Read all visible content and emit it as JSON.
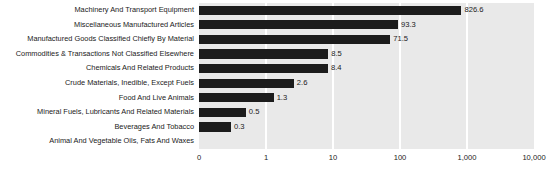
{
  "chart_data": {
    "type": "bar",
    "orientation": "horizontal",
    "title": "",
    "xlabel": "",
    "ylabel": "",
    "xscale": "log",
    "grid": true,
    "legend": false,
    "xticks": [
      "0",
      "1",
      "10",
      "100",
      "1,000",
      "10,000"
    ],
    "xtick_values": [
      0,
      1,
      10,
      100,
      1000,
      10000
    ],
    "categories": [
      "Machinery And Transport Equipment",
      "Miscellaneous Manufactured Articles",
      "Manufactured Goods Classified Chiefly By Material",
      "Commodities & Transactions Not Classified Elsewhere",
      "Chemicals And Related Products",
      "Crude Materials, Inedible, Except Fuels",
      "Food And Live Animals",
      "Mineral Fuels, Lubricants And Related Materials",
      "Beverages And Tobacco",
      "Animal And Vegetable Oils, Fats And Waxes"
    ],
    "values": [
      826.6,
      93.3,
      71.5,
      8.5,
      8.4,
      2.6,
      1.3,
      0.5,
      0.3,
      0
    ],
    "value_labels": [
      "826.6",
      "93.3",
      "71.5",
      "8.5",
      "8.4",
      "2.6",
      "1.3",
      "0.5",
      "0.3",
      ""
    ],
    "colors": {
      "bar": "#1c1c1c",
      "plot_background": "#e9e9e9",
      "gridline": "#ffffff",
      "text": "#1a1a1a",
      "page_background": "#ffffff"
    }
  }
}
